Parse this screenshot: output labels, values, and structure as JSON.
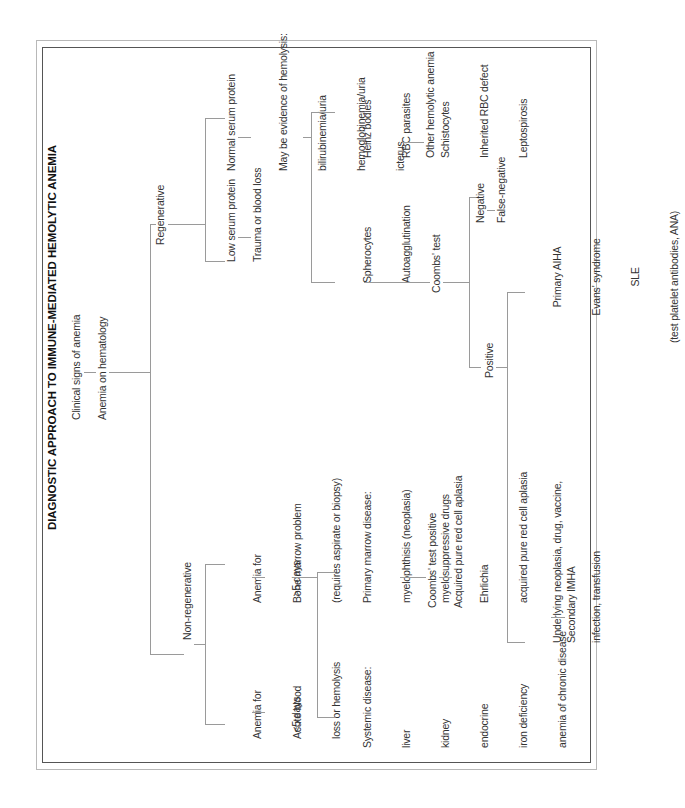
{
  "document": {
    "title": "DIAGNOSTIC APPROACH TO IMMUNE-MEDIATED HEMOLYTIC ANEMIA",
    "orientation": "rotated 90° counterclockwise",
    "flowchart": {
      "root": {
        "clinical": "Clinical signs of anemia",
        "hematology": "Anemia on hematology"
      },
      "regenerative": {
        "label": "Regenerative",
        "low_serum_protein": "Low serum protein",
        "trauma": "Trauma or blood loss",
        "normal_serum_protein": "Normal serum protein",
        "hemolysis_evidence": [
          "May be evidence of hemolysis:",
          "bilirubinemia/uria",
          "hemoglobinemia/uria",
          "icterus"
        ],
        "spherocytes": [
          "Spherocytes",
          "Autoagglutination"
        ],
        "other_causes": [
          "Heinz bodies",
          "RBC parasites",
          "Schistocytes",
          "Inherited RBC defect",
          "Leptospirosis"
        ],
        "other_hemolytic": "Other hemolytic anemia",
        "coombs_test": "Coombs' test",
        "negative": "Negative",
        "false_negative": "False-negative",
        "positive": "Positive",
        "primary": [
          "Primary AIHA",
          "Evans' syndrome",
          "SLE",
          "(test platelet antibodies, ANA)"
        ],
        "underlying": [
          "Underlying neoplasia, drug, vaccine,",
          "infection, transfusion"
        ],
        "secondary": "Secondary IMHA"
      },
      "non_regenerative": {
        "label": "Non-regenerative",
        "short": [
          "Anemia for",
          "<5 days"
        ],
        "acute": [
          "Acute blood",
          "loss or hemolysis"
        ],
        "long": [
          "Anemia for",
          ">5 days"
        ],
        "bone_marrow": [
          "Bone marrow problem",
          "(requires aspirate or biopsy)"
        ],
        "systemic": [
          "Systemic disease:",
          "liver",
          "kidney",
          "endocrine",
          "iron deficiency",
          "anemia of chronic disease"
        ],
        "primary_marrow": [
          "Primary marrow disease:",
          "myelophthisis (neoplasia)",
          "myelosuppressive drugs",
          "Ehrlichia",
          "acquired pure red cell aplasia"
        ],
        "coombs_positive": "Coombs' test positive",
        "acquired_prca": "Acquired pure red cell aplasia"
      }
    }
  },
  "colors": {
    "line": "#9a9a9a",
    "text": "#333333",
    "border": "#555555"
  }
}
